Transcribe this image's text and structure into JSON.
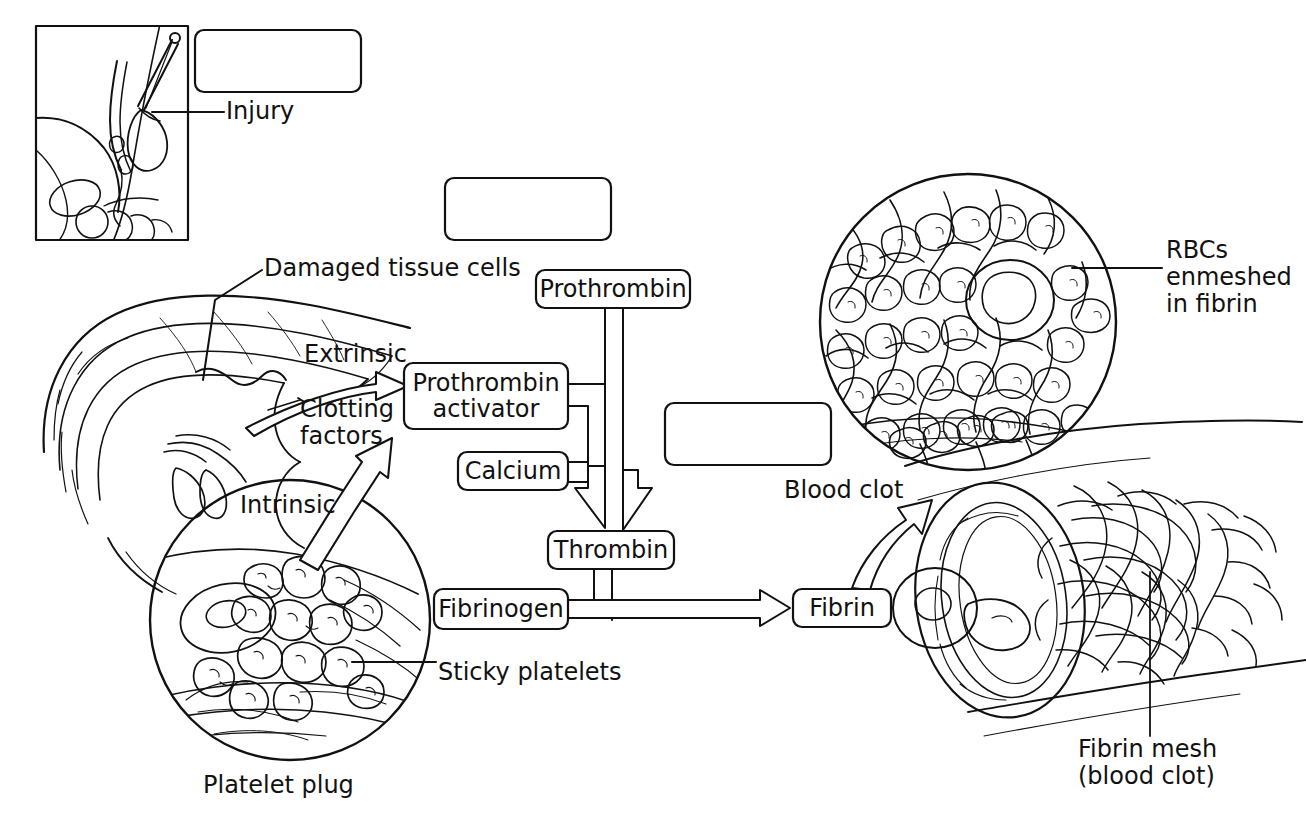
{
  "diagram": {
    "stroke_color": "#111111",
    "background_color": "#ffffff"
  },
  "flowchart": {
    "boxes": [
      {
        "id": "prothrombin",
        "label": "Prothrombin"
      },
      {
        "id": "prothrombin-activator",
        "label": "Prothrombin\nactivator"
      },
      {
        "id": "calcium",
        "label": "Calcium"
      },
      {
        "id": "thrombin",
        "label": "Thrombin"
      },
      {
        "id": "fibrinogen",
        "label": "Fibrinogen"
      },
      {
        "id": "fibrin",
        "label": "Fibrin"
      }
    ],
    "blank_boxes": [
      {
        "id": "blank-box-1",
        "label": ""
      },
      {
        "id": "blank-box-2",
        "label": ""
      },
      {
        "id": "blank-box-3",
        "label": ""
      }
    ],
    "pathway_labels": [
      {
        "id": "extrinsic",
        "label": "Extrinsic"
      },
      {
        "id": "intrinsic",
        "label": "Intrinsic"
      },
      {
        "id": "clotting-factors",
        "label": "Clotting\nfactors"
      }
    ]
  },
  "callouts": {
    "injury": "Injury",
    "damaged_tissue": "Damaged tissue cells",
    "sticky_platelets": "Sticky platelets",
    "platelet_plug": "Platelet plug",
    "blood_clot": "Blood clot",
    "rbcs_enmeshed": "RBCs\nenmeshed\nin fibrin",
    "fibrin_mesh": "Fibrin mesh\n(blood clot)"
  },
  "illustrations": [
    {
      "id": "injury-inset",
      "name": "foot-with-injury-illustration"
    },
    {
      "id": "vessel-cutaway",
      "name": "damaged-blood-vessel-illustration"
    },
    {
      "id": "platelet-plug-inset",
      "name": "platelet-plug-magnification"
    },
    {
      "id": "rbc-clot-inset",
      "name": "rbcs-enmeshed-in-fibrin-magnification"
    },
    {
      "id": "fibrin-vessel",
      "name": "vessel-with-fibrin-mesh-illustration"
    }
  ]
}
